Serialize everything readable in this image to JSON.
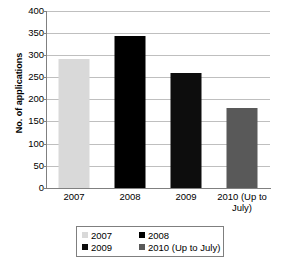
{
  "chart_data": {
    "type": "bar",
    "title": "",
    "xlabel": "",
    "ylabel": "No. of applications",
    "categories": [
      "2007",
      "2008",
      "2009",
      "2010 (Up to July)"
    ],
    "values": [
      292,
      344,
      261,
      180
    ],
    "series": [
      {
        "name": "No. of applications",
        "values": [
          292,
          344,
          261,
          180
        ]
      }
    ],
    "ylim": [
      0,
      400
    ],
    "ytick_labels": [
      "400",
      "350",
      "300",
      "250",
      "200",
      "150",
      "100",
      "50",
      "0"
    ],
    "ytick_values": [
      400,
      350,
      300,
      250,
      200,
      150,
      100,
      50,
      0
    ],
    "grid": true,
    "legend_position": "bottom",
    "bar_colors": [
      "#d9d9d9",
      "#000000",
      "#0d0d0d",
      "#595959"
    ],
    "legend": [
      {
        "label": "2007",
        "color": "#d9d9d9"
      },
      {
        "label": "2008",
        "color": "#000000"
      },
      {
        "label": "2009",
        "color": "#0d0d0d"
      },
      {
        "label": "2010 (Up to July)",
        "color": "#595959"
      }
    ],
    "xtick_lines": [
      [
        "2007"
      ],
      [
        "2008"
      ],
      [
        "2009"
      ],
      [
        "2010 (Up to",
        "July)"
      ]
    ]
  },
  "colors": {
    "gridline": "#bfbfbf",
    "axis": "#808080",
    "legend_border": "#7f7f7f",
    "background": "#ffffff",
    "text": "#000000"
  }
}
